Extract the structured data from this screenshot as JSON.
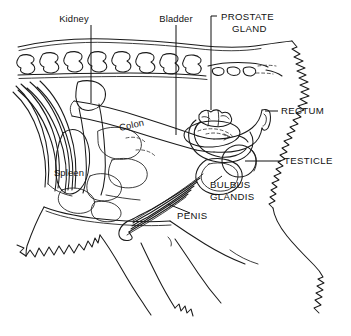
{
  "figure": {
    "type": "anatomical-line-diagram",
    "background_color": "#ffffff",
    "line_color": "#1a1a1a",
    "text_color": "#111111"
  },
  "labels": {
    "kidney": "Kidney",
    "bladder": "Bladder",
    "prostate_line1": "PROSTATE",
    "prostate_line2": "GLAND",
    "rectum": "RECTUM",
    "testicle": "TESTICLE",
    "bulbus_line1": "BULBUS",
    "bulbus_line2": "GLANDIS",
    "penis": "PENIS",
    "colon": "Colon",
    "spleen": "Spleen"
  },
  "label_styles": {
    "kidney": "mixed-case",
    "bladder": "mixed-case",
    "colon": "mixed-case",
    "spleen": "mixed-case",
    "prostate_gland": "uppercase",
    "rectum": "uppercase",
    "testicle": "uppercase",
    "bulbus_glandis": "uppercase",
    "penis": "uppercase"
  },
  "structures": [
    "lumbar vertebrae",
    "sacral vertebrae",
    "ribs",
    "kidney",
    "spleen",
    "colon",
    "bladder",
    "prostate gland",
    "rectum",
    "bulbus glandis",
    "testicle",
    "penis",
    "intestines",
    "hind limb outline",
    "tail fur outline"
  ]
}
